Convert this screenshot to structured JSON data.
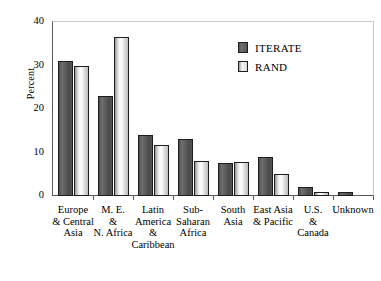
{
  "chart_data": {
    "type": "bar",
    "title": "",
    "subtitle": "",
    "xlabel": "",
    "ylabel": "Percent",
    "ylim": [
      0,
      40
    ],
    "yticks": [
      0,
      10,
      20,
      30,
      40
    ],
    "ytick_labels": [
      "0",
      "10",
      "20",
      "30",
      "40"
    ],
    "grid": false,
    "legend_position": "top-right",
    "categories": [
      "Europe\n& Central\nAsia",
      "M. E.\n&\nN. Africa",
      "Latin\nAmerica\n&\nCaribbean",
      "Sub-\nSaharan\nAfrica",
      "South\nAsia",
      "East Asia\n& Pacific",
      "U.S.\n&\nCanada",
      "Unknown"
    ],
    "series": [
      {
        "name": "ITERATE",
        "color": "#5c5c5c",
        "values": [
          31,
          23,
          14,
          13,
          7.7,
          9,
          2,
          1
        ]
      },
      {
        "name": "RAND",
        "color": "#f0f0f0",
        "values": [
          30,
          36.5,
          11.7,
          8,
          7.9,
          5,
          1,
          0
        ]
      }
    ]
  },
  "axes": {
    "y_title": "Percent"
  },
  "legend": {
    "entries": [
      {
        "label": "ITERATE",
        "swatch": "dark-gray-swatch"
      },
      {
        "label": "RAND",
        "swatch": "light-gray-swatch"
      }
    ]
  }
}
